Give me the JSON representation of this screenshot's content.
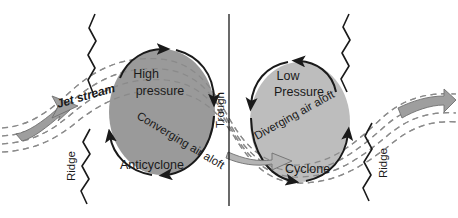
{
  "figure": {
    "type": "diagram",
    "background_color": "#ffffff",
    "ink_color": "#1a1a1a",
    "ellipse_fill": "#9a9a9a",
    "ellipse_fill_light": "#bdbdbd",
    "jet_arrow_fill": "#9e9e9e",
    "dashed_line_color": "#9a9a9a"
  },
  "labels": {
    "high_pressure_line1": "High",
    "high_pressure_line2": "pressure",
    "low_pressure_line1": "Low",
    "low_pressure_line2": "Pressure",
    "anticyclone": "Anticyclone",
    "cyclone": "Cyclone",
    "jet_stream": "Jet stream",
    "converging": "Converging air aloft",
    "diverging": "Diverging air aloft",
    "trough": "Trough",
    "ridge_left": "Ridge",
    "ridge_right": "Ridge"
  },
  "annotations": {
    "axis_line": "trough-axis-vertical-line",
    "wavy_markers": [
      "ridge-axis-left-wavy",
      "trough-axis-top-wavy",
      "trough-axis-bottom-wavy",
      "ridge-axis-right-wavy"
    ]
  }
}
